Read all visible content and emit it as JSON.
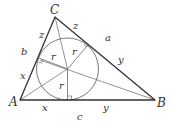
{
  "diagram": {
    "vertices": {
      "A": {
        "label": "A",
        "x": 20,
        "y": 100
      },
      "B": {
        "label": "B",
        "x": 155,
        "y": 100
      },
      "C": {
        "label": "C",
        "x": 55,
        "y": 17
      }
    },
    "incircle": {
      "cx": 67.5,
      "cy": 69,
      "r": 31
    },
    "side_labels": {
      "a": "a",
      "b": "b",
      "c": "c"
    },
    "tangent_segment_labels": {
      "x": "x",
      "y": "y",
      "z": "z"
    },
    "radius_label": "r"
  }
}
